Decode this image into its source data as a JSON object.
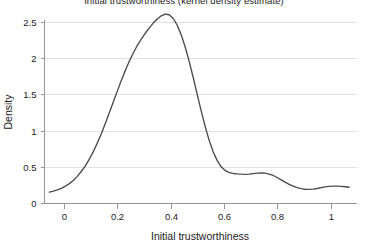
{
  "chart_data": {
    "type": "line",
    "title": "Initial trustworthiness (kernel density estimate)",
    "xlabel": "Initial trustworthiness",
    "ylabel": "Density",
    "xlim": [
      -0.07,
      1.08
    ],
    "ylim": [
      0,
      2.72
    ],
    "xticks": [
      0,
      0.2,
      0.4,
      0.6,
      0.8,
      1
    ],
    "xticklabels": [
      "0",
      "0.2",
      "0.4",
      "0.6",
      "0.8",
      "1"
    ],
    "yticks": [
      0,
      0.5,
      1,
      1.5,
      2,
      2.5
    ],
    "yticklabels": [
      "0",
      "0.5",
      "1",
      "1.5",
      "2",
      "2.5"
    ],
    "grid": "horizontal",
    "legend": "none",
    "series": [
      {
        "name": "Initial trustworthiness density",
        "color": "#4a4a4a",
        "x": [
          -0.055,
          -0.04,
          -0.025,
          -0.01,
          0.005,
          0.02,
          0.035,
          0.05,
          0.065,
          0.08,
          0.095,
          0.11,
          0.125,
          0.14,
          0.155,
          0.17,
          0.185,
          0.2,
          0.215,
          0.23,
          0.245,
          0.26,
          0.275,
          0.29,
          0.305,
          0.32,
          0.335,
          0.35,
          0.365,
          0.38,
          0.395,
          0.41,
          0.425,
          0.44,
          0.455,
          0.47,
          0.485,
          0.5,
          0.515,
          0.53,
          0.545,
          0.56,
          0.575,
          0.59,
          0.605,
          0.62,
          0.635,
          0.65,
          0.665,
          0.68,
          0.695,
          0.71,
          0.725,
          0.74,
          0.755,
          0.77,
          0.785,
          0.8,
          0.815,
          0.83,
          0.845,
          0.86,
          0.875,
          0.89,
          0.905,
          0.92,
          0.935,
          0.95,
          0.965,
          0.98,
          0.995,
          1.01,
          1.025,
          1.04,
          1.055,
          1.07
        ],
        "y": [
          0.15,
          0.163,
          0.18,
          0.203,
          0.232,
          0.268,
          0.312,
          0.368,
          0.435,
          0.513,
          0.605,
          0.71,
          0.828,
          0.958,
          1.098,
          1.245,
          1.395,
          1.545,
          1.692,
          1.83,
          1.958,
          2.072,
          2.175,
          2.265,
          2.345,
          2.418,
          2.485,
          2.54,
          2.585,
          2.61,
          2.6,
          2.548,
          2.455,
          2.322,
          2.152,
          1.952,
          1.73,
          1.498,
          1.268,
          1.052,
          0.862,
          0.705,
          0.585,
          0.5,
          0.448,
          0.42,
          0.408,
          0.402,
          0.398,
          0.396,
          0.398,
          0.405,
          0.412,
          0.416,
          0.412,
          0.4,
          0.38,
          0.352,
          0.32,
          0.288,
          0.258,
          0.232,
          0.212,
          0.198,
          0.19,
          0.188,
          0.192,
          0.2,
          0.212,
          0.222,
          0.23,
          0.234,
          0.234,
          0.23,
          0.224,
          0.218
        ]
      }
    ]
  },
  "axes": {
    "y_title": "Density",
    "x_title": "Initial trustworthiness"
  }
}
